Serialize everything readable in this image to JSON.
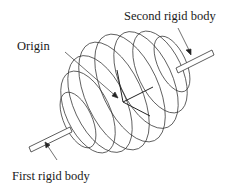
{
  "labels": {
    "second_body": "Second rigid body",
    "origin": "Origin",
    "first_body": "First rigid body"
  },
  "colors": {
    "line": "#333333",
    "text": "#1a1a1a",
    "background": "#ffffff"
  }
}
